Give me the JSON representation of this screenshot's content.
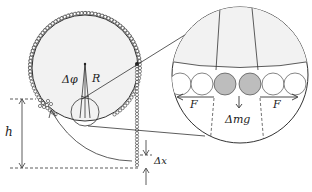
{
  "diagram": {
    "labels": {
      "delta_phi": "Δφ",
      "radius": "R",
      "height": "h",
      "delta_x": "Δx",
      "force_left": "F",
      "force_right": "F",
      "delta_mg": "Δmg"
    },
    "colors": {
      "stroke": "#333333",
      "disk_fill": "#f2f2f2",
      "highlight_bead": "#bdbdbd",
      "bead_fill": "#ffffff"
    }
  }
}
